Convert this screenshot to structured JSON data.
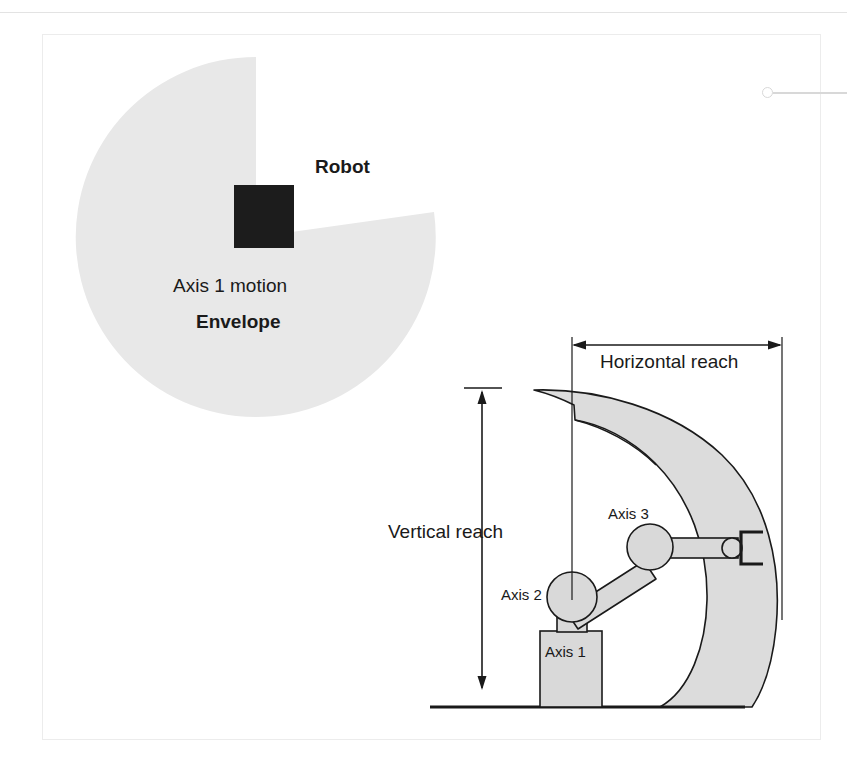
{
  "figure": {
    "kind": "technical-diagram",
    "labels": {
      "robot": "Robot",
      "axis1_motion": "Axis 1 motion",
      "envelope": "Envelope",
      "horizontal_reach": "Horizontal reach",
      "vertical_reach": "Vertical reach",
      "axis1": "Axis 1",
      "axis2": "Axis 2",
      "axis3": "Axis 3"
    },
    "colors": {
      "envelope_fill_top": "#e8e8e8",
      "envelope_fill_side": "#dcdcdc",
      "robot_body": "#1c1c1c",
      "arm_fill": "#d9d9d9",
      "outline": "#1a1a1a",
      "card_border": "#ececec",
      "callout": "#d8d8d8",
      "text": "#1a1a1a"
    },
    "top_view": {
      "description": "Plan view: circular Axis 1 motion envelope with a wedge cut out; dark square robot at center",
      "center": [
        256,
        237
      ],
      "radius": 180,
      "wedge_start_deg": -90,
      "wedge_end_deg": -8,
      "robot_square": {
        "x": 234,
        "y": 185,
        "w": 60,
        "h": 63
      }
    },
    "side_view": {
      "description": "Side elevation: crescent-shaped work envelope, three-axis arm on a pedestal base, ground line",
      "ground_line_y": 707,
      "ground_line_x1": 430,
      "ground_line_x2": 745,
      "base": {
        "x": 540,
        "y": 631,
        "w": 62,
        "h": 76
      },
      "column": {
        "x": 556,
        "y": 600,
        "w": 30,
        "h": 31
      },
      "joints": [
        {
          "name": "Axis 2",
          "cx": 572,
          "cy": 597,
          "r": 25
        },
        {
          "name": "Axis 3",
          "cx": 650,
          "cy": 547,
          "r": 23
        },
        {
          "name": "wrist",
          "cx": 731,
          "cy": 548,
          "r": 10
        }
      ],
      "gripper": {
        "x": 740,
        "y": 532,
        "w": 23,
        "h": 32
      },
      "horizontal_reach_arrow": {
        "y": 345,
        "x1": 572,
        "x2": 782
      },
      "vertical_reach_arrow": {
        "x": 482,
        "y1": 390,
        "y2": 690
      }
    }
  }
}
